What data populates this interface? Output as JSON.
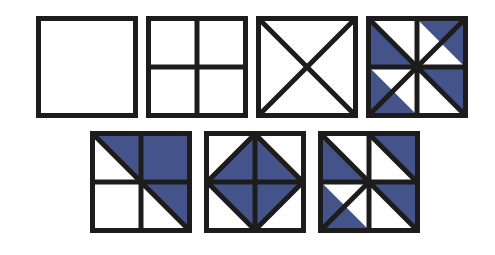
{
  "figure": {
    "name": "quilt-block-pattern-sequence",
    "background_color": "#ffffff",
    "line_color": "#1c1c1c",
    "fill_color": "#44548a",
    "empty_color": "#ffffff",
    "rows": [
      {
        "name": "top-row",
        "count": 4
      },
      {
        "name": "bottom-row",
        "count": 3
      }
    ]
  },
  "chart_data": {
    "type": "diagram",
    "title": "",
    "subtitle": "",
    "xlabel": "",
    "ylabel": "",
    "legend": [],
    "annotations": [],
    "shape": "square",
    "tile_count": 7,
    "colors": {
      "fill": "#44548a",
      "stroke": "#1c1c1c",
      "empty": "#ffffff"
    },
    "tiles": [
      {
        "index": 1,
        "label": "plain-square",
        "x": 36,
        "y": 16,
        "size": 102,
        "lines": [],
        "filled_regions": [],
        "fill_fraction": 0
      },
      {
        "index": 2,
        "label": "four-patch-grid",
        "x": 146,
        "y": 16,
        "size": 102,
        "lines": [
          "vertical-center",
          "horizontal-center"
        ],
        "filled_regions": [],
        "fill_fraction": 0
      },
      {
        "index": 3,
        "label": "x-cross-diagonals",
        "x": 256,
        "y": 16,
        "size": 102,
        "lines": [
          "diagonal-main",
          "diagonal-anti"
        ],
        "filled_regions": [],
        "fill_fraction": 0
      },
      {
        "index": 4,
        "label": "pinwheel-four-quadrant",
        "x": 366,
        "y": 16,
        "size": 102,
        "lines": [
          "vertical-center",
          "horizontal-center",
          "diagonal-main",
          "diagonal-anti"
        ],
        "filled_regions": [
          "q-topleft-lower-left-triangle",
          "q-topright-upper-right-triangle",
          "q-bottomleft-lower-left-triangle",
          "q-bottomright-upper-right-triangle"
        ],
        "fill_fraction": 0.5
      },
      {
        "index": 5,
        "label": "half-block-diagonal",
        "x": 90,
        "y": 131,
        "size": 102,
        "lines": [
          "vertical-center",
          "horizontal-center",
          "diagonal-main"
        ],
        "filled_regions": [
          "q-topleft-upper-right-triangle",
          "q-topright-full",
          "q-bottomright-upper-right-triangle"
        ],
        "fill_fraction": 0.5
      },
      {
        "index": 6,
        "label": "center-diamond",
        "x": 204,
        "y": 131,
        "size": 102,
        "lines": [
          "vertical-center",
          "horizontal-center",
          "diamond-edges"
        ],
        "filled_regions": [
          "diamond-north-triangle",
          "diamond-east-triangle",
          "diamond-south-triangle",
          "diamond-west-triangle"
        ],
        "fill_fraction": 0.5
      },
      {
        "index": 7,
        "label": "broken-pinwheel",
        "x": 318,
        "y": 131,
        "size": 102,
        "lines": [
          "vertical-center",
          "horizontal-center",
          "quadrant-diagonals"
        ],
        "filled_regions": [
          "q-topleft-lower-left-triangle",
          "q-topright-upper-right-triangle",
          "q-bottomleft-lower-left-triangle",
          "q-bottomright-upper-right-triangle"
        ],
        "fill_fraction": 0.5
      }
    ]
  }
}
